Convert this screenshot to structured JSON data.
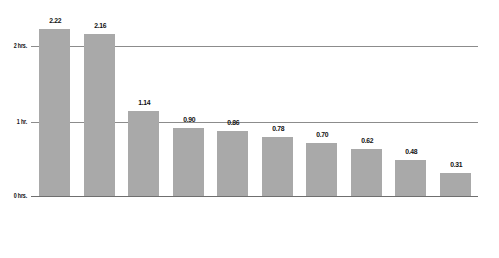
{
  "chart_data": {
    "type": "bar",
    "title": "",
    "xlabel": "",
    "ylabel": "",
    "ylim": [
      0,
      2.5
    ],
    "grid": true,
    "legend": "none",
    "bar_color": "#a9a9a9",
    "gridline_color": "#8c8c8c",
    "value_label_format": "2 decimals",
    "y_ticks": [
      {
        "value": 0,
        "label": "0 hrs."
      },
      {
        "value": 1,
        "label": "1 hr."
      },
      {
        "value": 2,
        "label": "2 hrs."
      }
    ],
    "categories": [
      "taking class",
      "television",
      "work, main job",
      "eating, drinking",
      "socializing and communicating",
      "grooming",
      "participating in sports, exercise, recreation",
      "research, homework",
      "playing games (including computer)",
      "computer use for leisure (except games)"
    ],
    "category_lines": [
      [
        "taking",
        "class"
      ],
      [
        "television"
      ],
      [
        "work,",
        "main job"
      ],
      [
        "eating,",
        "drinking"
      ],
      [
        "socializing and",
        "communicating"
      ],
      [
        "grooming"
      ],
      [
        "participating",
        "in sports,",
        "exercise,",
        "recreation"
      ],
      [
        "research,",
        "homework"
      ],
      [
        "playing",
        "games",
        "(including",
        "computer)"
      ],
      [
        "computer use",
        "for leisure",
        "(except",
        "games)"
      ]
    ],
    "values": [
      2.22,
      2.16,
      1.14,
      0.9,
      0.86,
      0.78,
      0.7,
      0.62,
      0.48,
      0.31
    ],
    "value_labels": [
      "2.22",
      "2.16",
      "1.14",
      "0.90",
      "0.86",
      "0.78",
      "0.70",
      "0.62",
      "0.48",
      "0.31"
    ]
  }
}
